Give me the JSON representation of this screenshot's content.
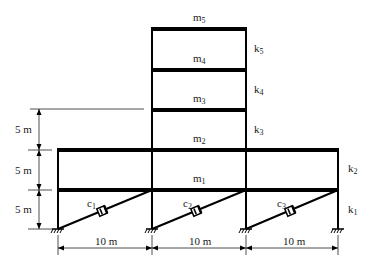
{
  "diagram": {
    "type": "structural-frame",
    "masses": [
      {
        "id": "m1",
        "base": "m",
        "sub": "1"
      },
      {
        "id": "m2",
        "base": "m",
        "sub": "2"
      },
      {
        "id": "m3",
        "base": "m",
        "sub": "3"
      },
      {
        "id": "m4",
        "base": "m",
        "sub": "4"
      },
      {
        "id": "m5",
        "base": "m",
        "sub": "5"
      }
    ],
    "stiffnesses": [
      {
        "id": "k1",
        "base": "k",
        "sub": "1"
      },
      {
        "id": "k2",
        "base": "k",
        "sub": "2"
      },
      {
        "id": "k3",
        "base": "k",
        "sub": "3"
      },
      {
        "id": "k4",
        "base": "k",
        "sub": "4"
      },
      {
        "id": "k5",
        "base": "k",
        "sub": "5"
      }
    ],
    "dampers": [
      {
        "id": "c1",
        "base": "c",
        "sub": "1"
      },
      {
        "id": "c2",
        "base": "c",
        "sub": "2"
      },
      {
        "id": "c3",
        "base": "c",
        "sub": "3"
      }
    ],
    "vertical_dimensions": [
      "5 m",
      "5 m",
      "5 m"
    ],
    "horizontal_dimensions": [
      "10 m",
      "10 m",
      "10 m"
    ],
    "colors": {
      "line": "#000000",
      "text": "#1a1a1a",
      "dimension": "#222222"
    }
  }
}
